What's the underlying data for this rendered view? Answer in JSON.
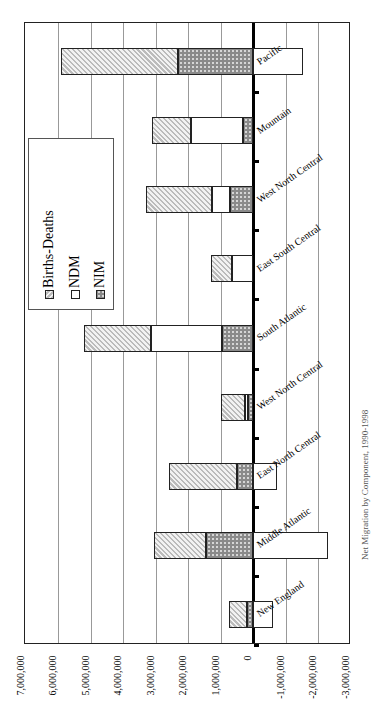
{
  "chart_data": {
    "type": "bar",
    "orientation": "rotated 90deg (horizontal stacked bars)",
    "stacked": true,
    "title": "Net Migration by Component, 1990-1998",
    "xlabel": "",
    "ylabel": "",
    "ylim": [
      -3000000,
      7000000
    ],
    "ticks": [
      "7,000,000",
      "6,000,000",
      "5,000,000",
      "4,000,000",
      "3,000,000",
      "2,000,000",
      "1,000,000",
      "0",
      "-1,000,000",
      "-2,000,000",
      "-3,000,000"
    ],
    "grid": true,
    "legend_position": "upper-left (rotated)",
    "categories": [
      "New England",
      "Middle Atlantic",
      "East North Central",
      "West North Central",
      "South Atlantic",
      "East South Central",
      "West North Central",
      "Mountain",
      "Pacific"
    ],
    "series": [
      {
        "name": "NIM",
        "values": [
          200000,
          1450000,
          500000,
          150000,
          950000,
          0,
          700000,
          300000,
          2300000
        ],
        "color": "#8a8a8a",
        "pattern": "dots"
      },
      {
        "name": "NDM",
        "values": [
          -600000,
          -2300000,
          -750000,
          100000,
          2200000,
          650000,
          550000,
          1600000,
          -1550000
        ],
        "color": "#ffffff",
        "pattern": "none"
      },
      {
        "name": "Births-Deaths",
        "values": [
          550000,
          1600000,
          2100000,
          750000,
          2050000,
          650000,
          2050000,
          1200000,
          3600000
        ],
        "color": "#bbbbbb",
        "pattern": "hatch"
      }
    ]
  },
  "legend": {
    "items": [
      {
        "label": "Births-Deaths"
      },
      {
        "label": "NDM"
      },
      {
        "label": "NIM"
      }
    ]
  },
  "axis": {
    "ticks": [
      "7,000,000",
      "6,000,000",
      "5,000,000",
      "4,000,000",
      "3,000,000",
      "2,000,000",
      "1,000,000",
      "0",
      "-1,000,000",
      "-2,000,000",
      "-3,000,000"
    ]
  },
  "categories": [
    "Pacific",
    "Mountain",
    "West North Central",
    "East South Central",
    "South Atlantic",
    "West North Central",
    "East North Central",
    "Middle Atlantic",
    "New England"
  ],
  "title": "Net Migration by Component, 1990-1998"
}
